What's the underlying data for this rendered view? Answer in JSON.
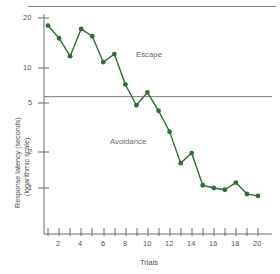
{
  "chart_data": {
    "type": "line",
    "title": "",
    "xlabel": "Trials",
    "ylabel": "Response latency (seconds)",
    "ylabel_line2": "(logarithmic scale)",
    "y_scale": "log",
    "ylim": [
      0.75,
      21
    ],
    "xlim": [
      0.4,
      20.6
    ],
    "grid": false,
    "legend": null,
    "y_ticks": [
      20,
      10,
      5,
      2,
      1
    ],
    "y_tick_labels": [
      "20",
      "10",
      "5",
      "2",
      "1"
    ],
    "x_ticks": [
      1,
      2,
      3,
      4,
      5,
      6,
      7,
      8,
      9,
      10,
      11,
      12,
      13,
      14,
      15,
      16,
      17,
      18,
      19,
      20
    ],
    "x_tick_labels": [
      "",
      "2",
      "",
      "4",
      "",
      "6",
      "",
      "8",
      "",
      "10",
      "",
      "12",
      "",
      "14",
      "",
      "16",
      "",
      "18",
      "",
      "20"
    ],
    "series": [
      {
        "name": "Response latency",
        "color": "#2e7031",
        "marker": "circle",
        "x": [
          1,
          2,
          3,
          4,
          5,
          6,
          7,
          8,
          9,
          10,
          11,
          12,
          13,
          14,
          15,
          16,
          17,
          18,
          19,
          20
        ],
        "values": [
          17.5,
          14.0,
          10.2,
          16.5,
          14.5,
          9.2,
          10.6,
          6.2,
          4.3,
          5.4,
          3.9,
          2.7,
          1.55,
          1.85,
          1.05,
          1.0,
          0.97,
          1.1,
          0.9,
          0.87
        ]
      }
    ],
    "reference_lines": [
      {
        "name": "escape-avoidance-threshold",
        "orientation": "horizontal",
        "value": 5,
        "color": "#7a7a7a"
      }
    ],
    "annotations": [
      {
        "name": "escape-label",
        "text": "Escape",
        "x": 11.5,
        "y": 8.3
      },
      {
        "name": "avoidance-label",
        "text": "Avoidance",
        "x": 9.0,
        "y": 2.6
      }
    ],
    "colors": {
      "line": "#2e7031",
      "marker": "#2e7031",
      "axis": "#6a6a6a",
      "tick_label": "#555555",
      "reference_line": "#7a7a7a",
      "top_rule": "#6f9b6a"
    }
  }
}
